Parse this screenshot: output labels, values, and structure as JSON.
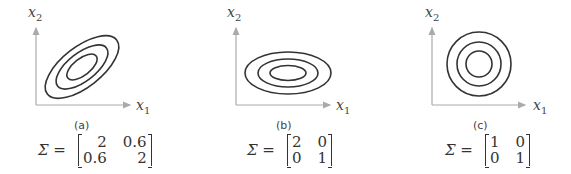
{
  "panels": [
    {
      "caption": "(a)",
      "x_label": "x",
      "x_sub": "1",
      "y_label": "x",
      "y_sub": "2",
      "sigma_symbol": "Σ =",
      "matrix": [
        [
          "2",
          "0.6"
        ],
        [
          "0.6",
          "2"
        ]
      ],
      "contour_shape": "tilted-ellipses"
    },
    {
      "caption": "(b)",
      "x_label": "x",
      "x_sub": "1",
      "y_label": "x",
      "y_sub": "2",
      "sigma_symbol": "Σ =",
      "matrix": [
        [
          "2",
          "0"
        ],
        [
          "0",
          "1"
        ]
      ],
      "contour_shape": "axis-aligned-ellipses"
    },
    {
      "caption": "(c)",
      "x_label": "x",
      "x_sub": "1",
      "y_label": "x",
      "y_sub": "2",
      "sigma_symbol": "Σ =",
      "matrix": [
        [
          "1",
          "0"
        ],
        [
          "0",
          "1"
        ]
      ],
      "contour_shape": "circles"
    }
  ],
  "colors": {
    "axis": "#aaaaaa",
    "contour": "#333333"
  }
}
